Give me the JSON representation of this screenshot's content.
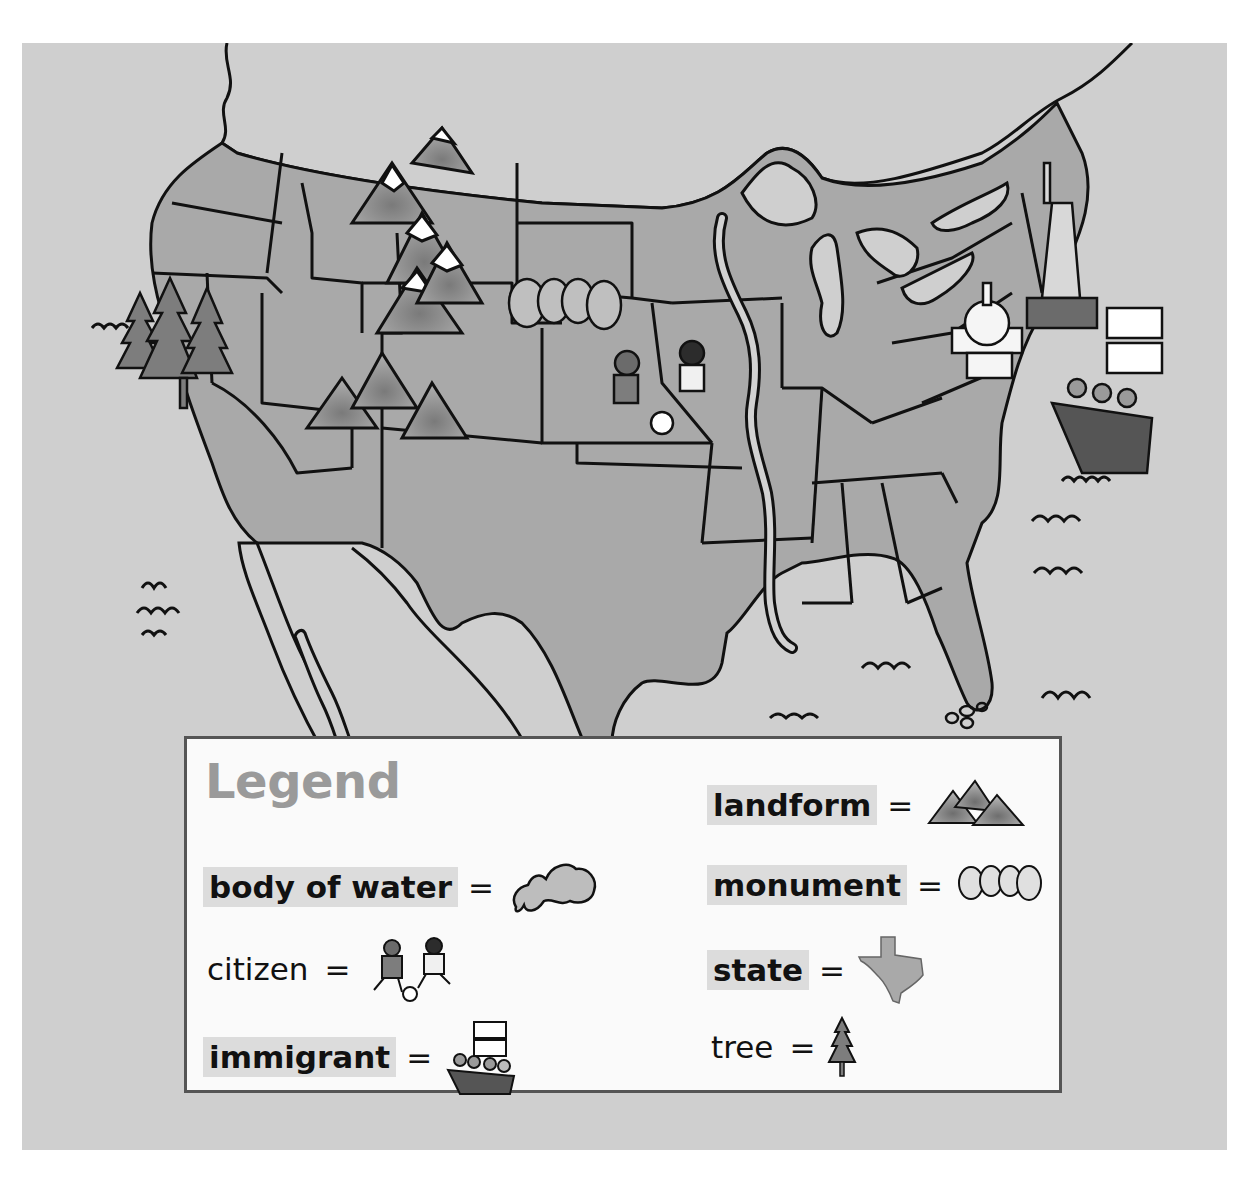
{
  "map": {
    "title": "United States illustrated map",
    "colors": {
      "water": "#cfcfcf",
      "land": "#a9a9a9",
      "river": "#d2d2d2",
      "outline": "#111111",
      "legend_bg": "#fafafa",
      "legend_border": "#555555",
      "highlight": "#dcdcdc",
      "legend_title": "#9a9a9a"
    },
    "illustrations": [
      "trees (Pacific Northwest)",
      "snowy mountains (Rockies)",
      "Mount Rushmore monument",
      "children playing soccer (citizens)",
      "mountains (Southwest)",
      "children waving (Great Lakes)",
      "Capitol building",
      "Statue of Liberty",
      "immigrant ship",
      "Appalachian mountains",
      "Mississippi River",
      "Great Lakes"
    ]
  },
  "legend": {
    "title": "Legend",
    "equals": "=",
    "items": [
      {
        "term": "body of water",
        "highlighted": true,
        "icon": "lake-icon"
      },
      {
        "term": "citizen",
        "highlighted": false,
        "icon": "citizens-soccer-icon"
      },
      {
        "term": "immigrant",
        "highlighted": true,
        "icon": "immigrant-ship-icon"
      },
      {
        "term": "landform",
        "highlighted": true,
        "icon": "mountains-icon"
      },
      {
        "term": "monument",
        "highlighted": true,
        "icon": "mount-rushmore-icon"
      },
      {
        "term": "state",
        "highlighted": true,
        "icon": "texas-state-icon"
      },
      {
        "term": "tree",
        "highlighted": false,
        "icon": "pine-tree-icon"
      }
    ]
  }
}
